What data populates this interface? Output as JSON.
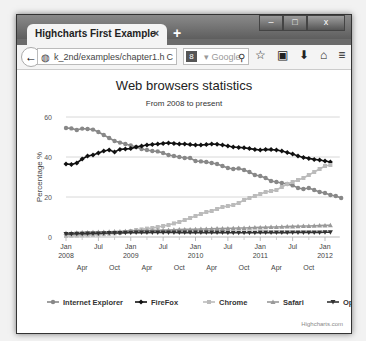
{
  "window": {
    "tab_title": "Highcharts First Example",
    "tab_close": "×",
    "new_tab": "+",
    "controls": {
      "minimize": "–",
      "maximize": "□",
      "close": "x"
    }
  },
  "navbar": {
    "back_icon": "←",
    "url": "k_2nd/examples/chapter1.h",
    "url_dropdown": "▿",
    "refresh_icon": "C",
    "search_engine": "8",
    "search_placeholder": "▾ Google",
    "search_icon": "⚲",
    "icons": [
      "☆",
      "▣",
      "⬇",
      "⌂",
      "≡"
    ]
  },
  "chart_data": {
    "type": "line",
    "title": "Web browsers statistics",
    "subtitle": "From 2008 to present",
    "ylabel": "Percentage %",
    "xlabel": "",
    "ylim": [
      0,
      60
    ],
    "yticks": [
      0,
      20,
      40,
      60
    ],
    "grid": true,
    "legend_position": "bottom",
    "credit": "Highcharts.com",
    "x_ticks_major": [
      {
        "label": "Jan",
        "year": "2008",
        "month_index": 0
      },
      {
        "label": "Jul",
        "year": "",
        "month_index": 6
      },
      {
        "label": "Jan",
        "year": "2009",
        "month_index": 12
      },
      {
        "label": "Jul",
        "year": "",
        "month_index": 18
      },
      {
        "label": "Jan",
        "year": "2010",
        "month_index": 24
      },
      {
        "label": "Jul",
        "year": "",
        "month_index": 30
      },
      {
        "label": "Jan",
        "year": "2011",
        "month_index": 36
      },
      {
        "label": "Jul",
        "year": "",
        "month_index": 42
      },
      {
        "label": "Jan",
        "year": "2012",
        "month_index": 48
      }
    ],
    "x_ticks_minor": [
      {
        "label": "Apr",
        "month_index": 3
      },
      {
        "label": "Oct",
        "month_index": 9
      },
      {
        "label": "Apr",
        "month_index": 15
      },
      {
        "label": "Oct",
        "month_index": 21
      },
      {
        "label": "Apr",
        "month_index": 27
      },
      {
        "label": "Oct",
        "month_index": 33
      },
      {
        "label": "Apr",
        "month_index": 39
      },
      {
        "label": "Oct",
        "month_index": 45
      }
    ],
    "x_start": "Jan 2008",
    "x_interval": "month",
    "series": [
      {
        "name": "Internet Explorer",
        "color": "#888888",
        "marker": "circle",
        "values": [
          54.5,
          54.3,
          53.5,
          54.2,
          54.0,
          53.7,
          52.5,
          51.0,
          49.5,
          48.0,
          47.2,
          46.5,
          45.8,
          45.0,
          44.0,
          43.5,
          43.0,
          42.8,
          42.0,
          41.0,
          40.5,
          40.0,
          39.5,
          39.5,
          38.0,
          37.8,
          37.5,
          37.0,
          36.5,
          35.5,
          34.5,
          34.0,
          34.3,
          33.5,
          32.5,
          31.0,
          30.5,
          29.5,
          28.0,
          27.5,
          27.0,
          26.5,
          25.8,
          24.5,
          24.0,
          24.5,
          23.5,
          22.5,
          22.0,
          21.0,
          20.5,
          19.5
        ]
      },
      {
        "name": "FireFox",
        "color": "#111111",
        "marker": "diamond",
        "values": [
          36.5,
          36.3,
          37.0,
          39.0,
          40.5,
          41.0,
          42.0,
          43.0,
          43.5,
          42.5,
          43.8,
          44.0,
          44.2,
          45.0,
          45.5,
          46.0,
          46.3,
          46.5,
          46.8,
          47.0,
          46.8,
          46.5,
          46.5,
          46.2,
          46.0,
          46.0,
          46.2,
          46.5,
          46.4,
          46.0,
          45.5,
          45.0,
          44.8,
          44.6,
          44.2,
          43.8,
          43.5,
          43.8,
          43.7,
          43.5,
          43.0,
          42.2,
          41.5,
          40.5,
          39.8,
          39.3,
          38.8,
          38.5,
          38.0,
          37.5
        ]
      },
      {
        "name": "Chrome",
        "color": "#bbbbbb",
        "marker": "square",
        "values": [
          0.5,
          0.6,
          0.7,
          0.8,
          0.9,
          1.0,
          1.2,
          1.4,
          1.6,
          1.8,
          2.0,
          2.5,
          3.0,
          3.5,
          3.8,
          4.2,
          4.5,
          5.0,
          5.5,
          6.0,
          6.8,
          7.5,
          8.5,
          9.5,
          10.5,
          11.5,
          12.5,
          13.0,
          14.0,
          15.0,
          15.5,
          16.0,
          17.0,
          18.5,
          19.5,
          20.5,
          21.5,
          22.5,
          23.0,
          23.5,
          25.0,
          26.5,
          27.5,
          28.5,
          29.5,
          31.0,
          32.5,
          34.0,
          35.5,
          36.0
        ]
      },
      {
        "name": "Safari",
        "color": "#999999",
        "marker": "triangle",
        "values": [
          2.0,
          2.0,
          2.1,
          2.2,
          2.3,
          2.4,
          2.5,
          2.5,
          2.6,
          2.7,
          2.8,
          2.9,
          3.0,
          3.0,
          3.1,
          3.2,
          3.3,
          3.4,
          3.5,
          3.5,
          3.6,
          3.7,
          3.8,
          3.8,
          3.9,
          4.0,
          4.0,
          4.1,
          4.2,
          4.2,
          4.3,
          4.4,
          4.5,
          4.5,
          4.6,
          4.7,
          4.8,
          4.9,
          5.0,
          5.0,
          5.1,
          5.2,
          5.3,
          5.4,
          5.5,
          5.5,
          5.6,
          5.7,
          5.8,
          5.9
        ]
      },
      {
        "name": "Opera",
        "color": "#333333",
        "marker": "triangle-down",
        "values": [
          1.5,
          1.5,
          1.6,
          1.6,
          1.7,
          1.8,
          1.8,
          1.9,
          2.0,
          2.0,
          2.0,
          2.1,
          2.1,
          2.2,
          2.2,
          2.2,
          2.3,
          2.3,
          2.3,
          2.3,
          2.3,
          2.2,
          2.2,
          2.2,
          2.2,
          2.2,
          2.2,
          2.2,
          2.2,
          2.2,
          2.1,
          2.1,
          2.1,
          2.1,
          2.1,
          2.1,
          2.2,
          2.2,
          2.2,
          2.2,
          2.2,
          2.2,
          2.3,
          2.3,
          2.3,
          2.3,
          2.3,
          2.3,
          2.4,
          2.4
        ]
      }
    ]
  }
}
